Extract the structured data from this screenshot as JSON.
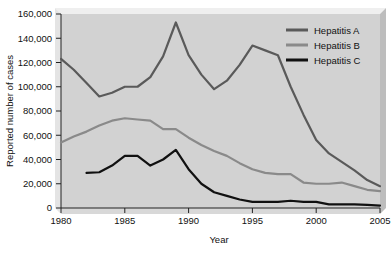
{
  "chart_data": {
    "type": "line",
    "title": "",
    "xlabel": "Year",
    "ylabel": "Reported number of cases",
    "xlim": [
      1980,
      2005
    ],
    "ylim": [
      0,
      160000
    ],
    "grid": false,
    "legend_position": "top-right",
    "xticks": [
      "1980",
      "1985",
      "1990",
      "1995",
      "2000",
      "2005"
    ],
    "xtick_values": [
      1980,
      1985,
      1990,
      1995,
      2000,
      2005
    ],
    "yticks": [
      "0",
      "20,000",
      "40,000",
      "60,000",
      "80,000",
      "100,000",
      "120,000",
      "140,000",
      "160,000"
    ],
    "ytick_values": [
      0,
      20000,
      40000,
      60000,
      80000,
      100000,
      120000,
      140000,
      160000
    ],
    "series": [
      {
        "name": "Hepatitis A",
        "color": "#5a5a5a",
        "x": [
          1980,
          1981,
          1982,
          1983,
          1984,
          1985,
          1986,
          1987,
          1988,
          1989,
          1990,
          1991,
          1992,
          1993,
          1994,
          1995,
          1996,
          1997,
          1998,
          1999,
          2000,
          2001,
          2002,
          2003,
          2004,
          2005
        ],
        "values": [
          123000,
          114000,
          103000,
          92000,
          95000,
          100000,
          100000,
          108000,
          125000,
          153000,
          126000,
          110000,
          98000,
          105000,
          118000,
          134000,
          130000,
          126000,
          100000,
          77000,
          56000,
          45000,
          38000,
          31000,
          23000,
          18000
        ]
      },
      {
        "name": "Hepatitis B",
        "color": "#8a8a8a",
        "x": [
          1980,
          1981,
          1982,
          1983,
          1984,
          1985,
          1986,
          1987,
          1988,
          1989,
          1990,
          1991,
          1992,
          1993,
          1994,
          1995,
          1996,
          1997,
          1998,
          1999,
          2000,
          2001,
          2002,
          2003,
          2004,
          2005
        ],
        "values": [
          54000,
          59000,
          63000,
          68000,
          72000,
          74000,
          73000,
          72000,
          65000,
          65000,
          58000,
          52000,
          47000,
          43000,
          37000,
          32000,
          29000,
          28000,
          28000,
          21000,
          20000,
          20000,
          21000,
          18000,
          15000,
          14000
        ]
      },
      {
        "name": "Hepatitis C",
        "color": "#111111",
        "x": [
          1982,
          1983,
          1984,
          1985,
          1986,
          1987,
          1988,
          1989,
          1990,
          1991,
          1992,
          1993,
          1994,
          1995,
          1996,
          1997,
          1998,
          1999,
          2000,
          2001,
          2002,
          2003,
          2004,
          2005
        ],
        "values": [
          29000,
          29500,
          35000,
          43000,
          43000,
          35000,
          40000,
          48000,
          32000,
          20000,
          13000,
          10000,
          7000,
          5000,
          5000,
          5000,
          6000,
          5000,
          5000,
          3000,
          3000,
          3000,
          2500,
          2000
        ]
      }
    ]
  },
  "legend": {
    "entries": [
      {
        "label": "Hepatitis A"
      },
      {
        "label": "Hepatitis B"
      },
      {
        "label": "Hepatitis C"
      }
    ]
  }
}
